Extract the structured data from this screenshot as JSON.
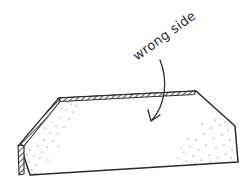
{
  "diagram": {
    "label": "wrong side",
    "colors": {
      "ink": "#2a2a2a",
      "background": "#ffffff",
      "stipple": "#555555"
    },
    "elements": [
      {
        "type": "fabric-piece",
        "description": "hexagonal fabric piece shown from wrong side"
      },
      {
        "type": "folded-edge",
        "description": "hatched folded hem along top and upper-left edges"
      },
      {
        "type": "annotation-arrow",
        "description": "curved arrow pointing from label to fabric surface"
      }
    ]
  }
}
